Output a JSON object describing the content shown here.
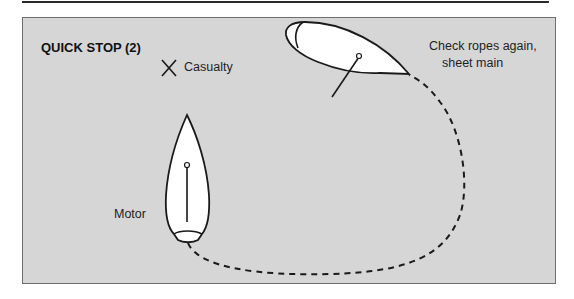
{
  "diagram": {
    "title": "QUICK STOP (2)",
    "labels": {
      "casualty": "Casualty",
      "check_ropes_line1": "Check ropes again,",
      "check_ropes_line2": "sheet main",
      "motor": "Motor"
    },
    "elements": {
      "casualty_marker": "x-mark-icon",
      "boat_top": "sailboat-hull-icon",
      "boat_bottom": "sailboat-hull-icon",
      "path": "dashed-course-line"
    },
    "colors": {
      "background": "#d6d6d6",
      "frame": "#6e6e6e",
      "hull_fill": "#ffffff",
      "stroke": "#1a1a1a"
    }
  }
}
